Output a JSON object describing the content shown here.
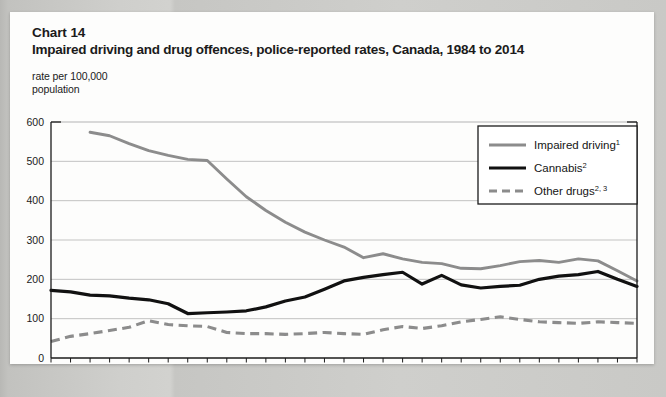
{
  "page": {
    "chart_number": "Chart 14",
    "title": "Impaired driving and drug offences, police-reported rates, Canada, 1984 to 2014",
    "axis_note_line1": "rate per 100,000",
    "axis_note_line2": "population"
  },
  "legend": {
    "items": [
      {
        "label": "Impaired driving",
        "sup": "1",
        "style": "solid",
        "color": "#8c8c8c"
      },
      {
        "label": "Cannabis",
        "sup": "2",
        "style": "solid",
        "color": "#111111"
      },
      {
        "label": "Other drugs",
        "sup": "2, 3",
        "style": "dashed",
        "color": "#8c8c8c"
      }
    ]
  },
  "chart_data": {
    "type": "line",
    "title": "Impaired driving and drug offences, police-reported rates, Canada, 1984 to 2014",
    "xlabel": "",
    "ylabel": "rate per 100,000 population",
    "xlim": [
      1984,
      2014
    ],
    "ylim": [
      0,
      600
    ],
    "yticks": [
      0,
      100,
      200,
      300,
      400,
      500,
      600
    ],
    "xticks": [
      1984,
      1987,
      1990,
      1993,
      1996,
      1999,
      2002,
      2005,
      2008,
      2011,
      2014
    ],
    "xtick_labels": [
      "1984",
      "1987",
      "1990",
      "1993",
      "1996",
      "1999",
      "2002",
      "2005",
      "2008",
      "2011",
      "2014"
    ],
    "ytick_labels": [
      "0",
      "100",
      "200",
      "300",
      "400",
      "500",
      "600"
    ],
    "grid": "horizontal",
    "legend_position": "top-right",
    "x": [
      1984,
      1985,
      1986,
      1987,
      1988,
      1989,
      1990,
      1991,
      1992,
      1993,
      1994,
      1995,
      1996,
      1997,
      1998,
      1999,
      2000,
      2001,
      2002,
      2003,
      2004,
      2005,
      2006,
      2007,
      2008,
      2009,
      2010,
      2011,
      2012,
      2013,
      2014
    ],
    "series": [
      {
        "name": "Impaired driving",
        "style": "solid",
        "color": "#8c8c8c",
        "values": [
          null,
          null,
          574,
          565,
          545,
          527,
          515,
          505,
          502,
          455,
          410,
          375,
          345,
          320,
          300,
          282,
          255,
          265,
          252,
          243,
          240,
          228,
          227,
          235,
          245,
          248,
          243,
          252,
          247,
          222,
          196
        ]
      },
      {
        "name": "Cannabis",
        "style": "solid",
        "color": "#111111",
        "values": [
          172,
          168,
          160,
          158,
          152,
          148,
          138,
          113,
          115,
          117,
          120,
          130,
          145,
          155,
          175,
          196,
          205,
          212,
          218,
          188,
          210,
          186,
          178,
          182,
          185,
          200,
          208,
          212,
          220,
          200,
          182
        ]
      },
      {
        "name": "Other drugs",
        "style": "dashed",
        "color": "#8c8c8c",
        "values": [
          42,
          55,
          62,
          70,
          78,
          95,
          85,
          82,
          80,
          65,
          62,
          62,
          60,
          62,
          65,
          62,
          60,
          72,
          80,
          75,
          82,
          92,
          98,
          105,
          98,
          92,
          90,
          88,
          92,
          90,
          88
        ]
      }
    ]
  }
}
